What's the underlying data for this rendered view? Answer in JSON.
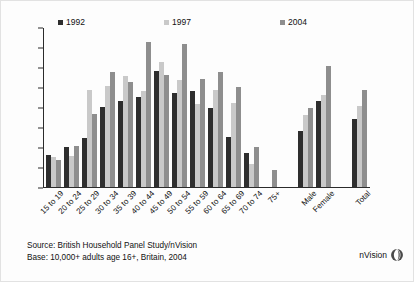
{
  "chart_data": {
    "type": "bar",
    "title": "",
    "xlabel": "",
    "ylabel": "",
    "ylim": [
      0,
      8
    ],
    "ytick_labels": [
      "0%",
      "1%",
      "2%",
      "3%",
      "4%",
      "5%",
      "6%",
      "7%",
      "8%"
    ],
    "ytick_values": [
      0,
      1,
      2,
      3,
      4,
      5,
      6,
      7,
      8
    ],
    "grid": false,
    "legend_position": "top",
    "categories": [
      "15 to 19",
      "20 to 24",
      "25 to 29",
      "30 to 34",
      "35 to 39",
      "40 to 44",
      "45 to 49",
      "50 to 54",
      "55 to 59",
      "60 to 64",
      "65 to 69",
      "70 to 74",
      "75+",
      "",
      "Male",
      "Female",
      "",
      "Total"
    ],
    "series": [
      {
        "name": "1992",
        "color": "#2e2e2e",
        "values": [
          1.6,
          2.0,
          2.45,
          4.0,
          4.3,
          4.5,
          5.8,
          4.7,
          4.8,
          3.95,
          2.5,
          1.7,
          null,
          null,
          2.8,
          4.3,
          null,
          3.4
        ]
      },
      {
        "name": "1997",
        "color": "#c9c9c9",
        "values": [
          1.5,
          1.55,
          4.85,
          5.05,
          5.55,
          4.8,
          6.25,
          5.35,
          4.15,
          4.85,
          4.2,
          1.15,
          null,
          null,
          3.6,
          4.6,
          null,
          4.05
        ]
      },
      {
        "name": "2004",
        "color": "#8e8e8e",
        "values": [
          1.35,
          2.05,
          3.65,
          5.75,
          5.25,
          7.25,
          5.6,
          7.15,
          5.4,
          5.75,
          5.0,
          2.0,
          0.85,
          null,
          3.95,
          6.05,
          null,
          4.85
        ]
      }
    ]
  },
  "legend": {
    "items": [
      {
        "label": "1992",
        "color": "#2e2e2e"
      },
      {
        "label": "1997",
        "color": "#c9c9c9"
      },
      {
        "label": "2004",
        "color": "#8e8e8e"
      }
    ]
  },
  "footer": {
    "source": "Source: British Household Panel Study/nVision",
    "base": "Base: 10,000+ adults age 16+, Britain, 2004"
  },
  "logo": {
    "text": "nVision"
  }
}
